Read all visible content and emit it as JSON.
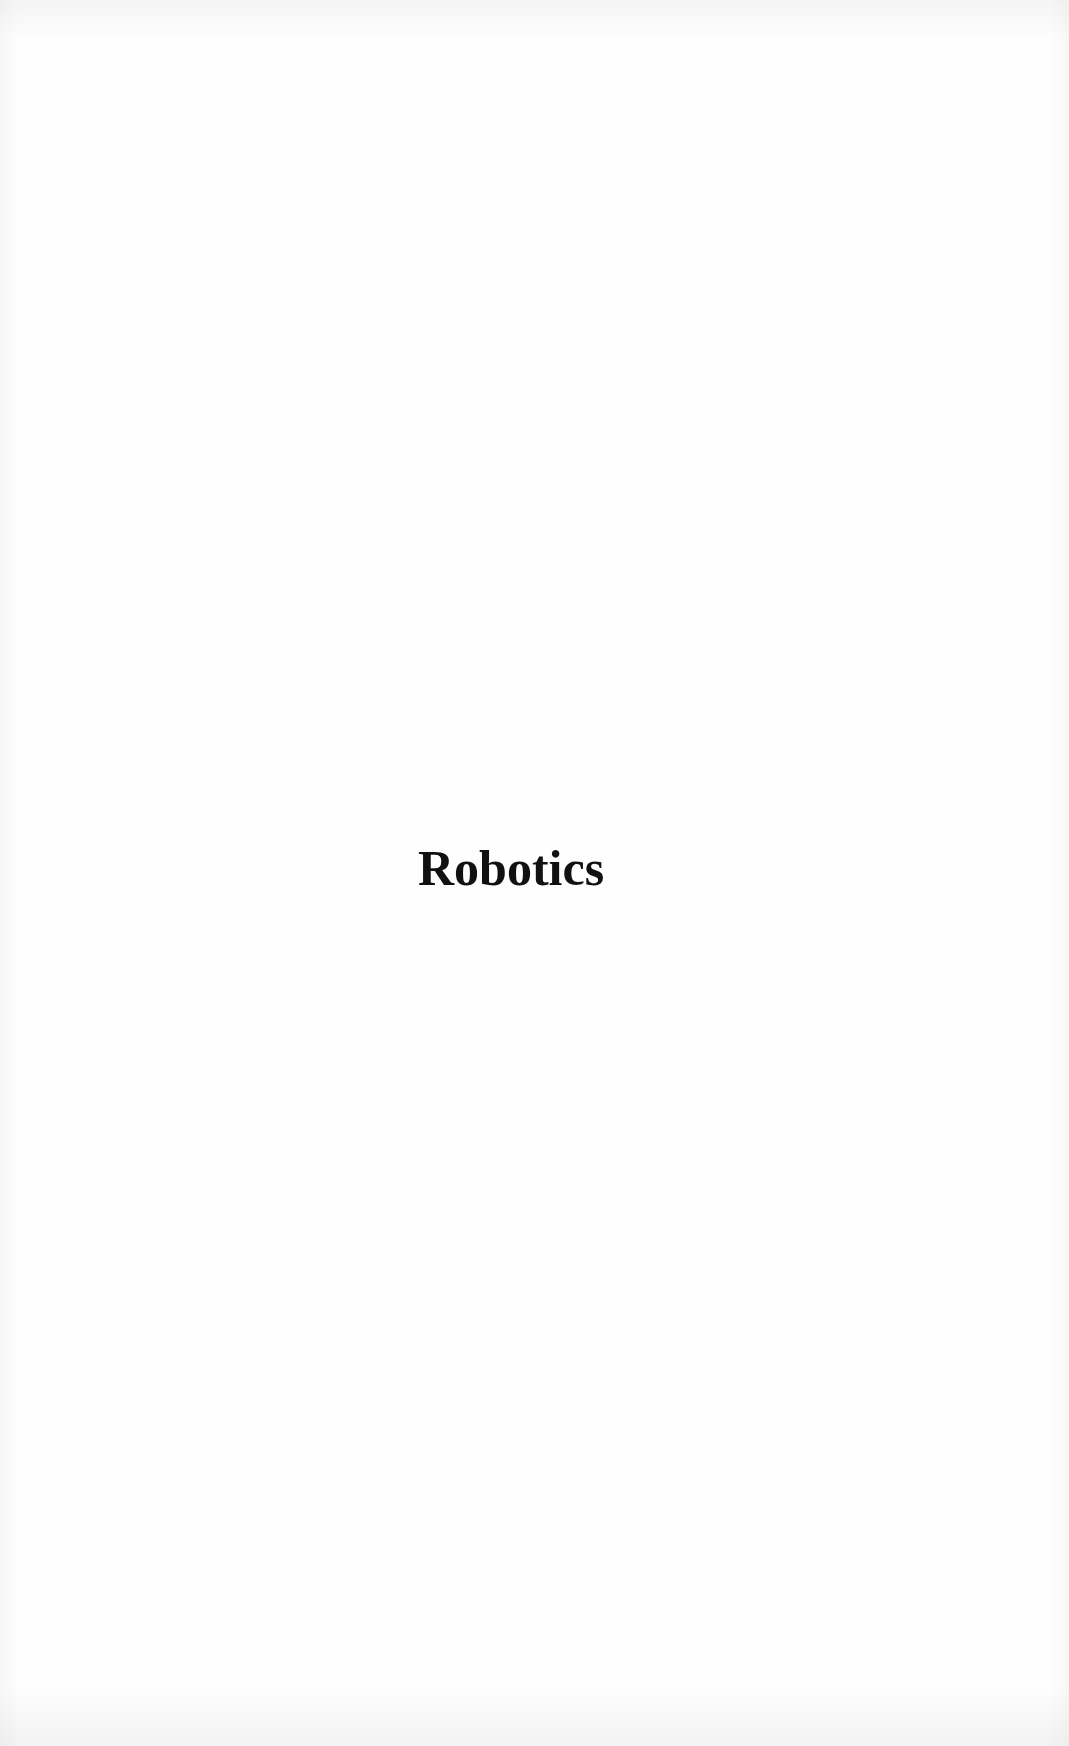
{
  "page": {
    "type": "section-title-page",
    "title": "Robotics",
    "colors": {
      "background": "#fefefe",
      "text": "#111111"
    }
  }
}
